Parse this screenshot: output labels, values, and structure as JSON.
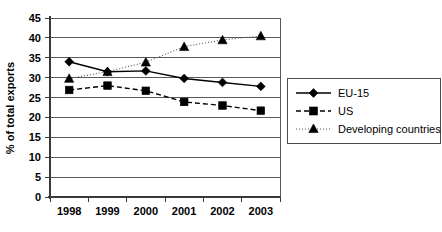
{
  "chart_data": {
    "type": "line",
    "title": "",
    "xlabel": "",
    "ylabel": "% of total exports",
    "categories": [
      "1998",
      "1999",
      "2000",
      "2001",
      "2002",
      "2003"
    ],
    "ylim": [
      0,
      45
    ],
    "yticks": [
      0,
      5,
      10,
      15,
      20,
      25,
      30,
      35,
      40,
      45
    ],
    "ytick_labels": [
      "0",
      "5",
      "10",
      "15",
      "20",
      "25",
      "30",
      "35",
      "40",
      "45"
    ],
    "grid": "horizontal",
    "legend_position": "right",
    "series": [
      {
        "name": "EU-15",
        "marker": "diamond",
        "line_style": "solid",
        "color": "#000000",
        "values": [
          34.0,
          31.5,
          31.7,
          29.8,
          28.8,
          27.8
        ]
      },
      {
        "name": "US",
        "marker": "square",
        "line_style": "dashed",
        "color": "#000000",
        "values": [
          26.9,
          28.0,
          26.7,
          23.9,
          23.0,
          21.7
        ]
      },
      {
        "name": "Developing countries",
        "marker": "triangle",
        "line_style": "dotted",
        "color": "#555555",
        "values": [
          29.8,
          31.5,
          33.9,
          37.8,
          39.5,
          40.5
        ]
      }
    ]
  },
  "axis": {
    "y_title": "% of total exports",
    "y_labels": [
      "45",
      "40",
      "35",
      "30",
      "25",
      "20",
      "15",
      "10",
      "5",
      "0"
    ],
    "x_labels": [
      "1998",
      "1999",
      "2000",
      "2001",
      "2002",
      "2003"
    ]
  },
  "legend": {
    "entries": [
      {
        "label": "EU-15"
      },
      {
        "label": "US"
      },
      {
        "label": "Developing countries"
      }
    ]
  }
}
